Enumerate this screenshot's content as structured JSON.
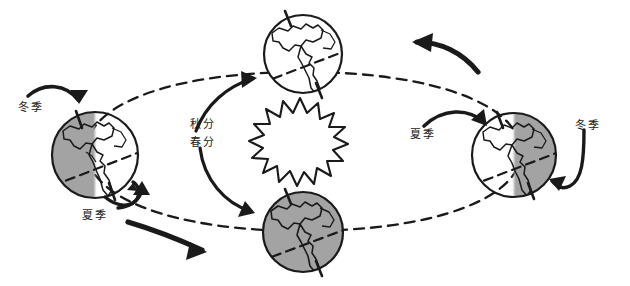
{
  "diagram": {
    "background_color": "#ffffff",
    "ink_color": "#1a1a1a",
    "shade_color": "#a3a3a3",
    "style": "hand-drawn-sketch"
  },
  "sun": {
    "name": "sun-starburst",
    "fill": "#ffffff",
    "stroke": "#1a1a1a",
    "points": 15,
    "center_x": 300,
    "center_y": 142
  },
  "orbit": {
    "name": "orbit-ellipse",
    "stroke": "#1a1a1a",
    "dash": "9 7",
    "center_x": 300,
    "center_y": 142,
    "radius_x": 215,
    "radius_y": 88
  },
  "globes": [
    {
      "id": "globe-left",
      "position": "left",
      "cx": 95,
      "cy": 155,
      "r": 44,
      "shade": "left-half",
      "label_season": "冬季"
    },
    {
      "id": "globe-top",
      "position": "top",
      "cx": 303,
      "cy": 54,
      "r": 40,
      "shade": "none",
      "label_season": "秋分"
    },
    {
      "id": "globe-bottom",
      "position": "bottom",
      "cx": 303,
      "cy": 232,
      "r": 41,
      "shade": "full",
      "label_season": "春分"
    },
    {
      "id": "globe-right",
      "position": "right",
      "cx": 514,
      "cy": 155,
      "r": 43,
      "shade": "right-half",
      "label_season": "夏季"
    }
  ],
  "labels": [
    {
      "id": "label-winter-left",
      "text": "冬季",
      "meaning": "winter",
      "x": 18,
      "y": 101
    },
    {
      "id": "label-summer-left",
      "text": "夏季",
      "meaning": "summer",
      "x": 82,
      "y": 209
    },
    {
      "id": "label-autumn-equinox",
      "text": "秋分",
      "meaning": "autumn equinox",
      "x": 190,
      "y": 118
    },
    {
      "id": "label-spring-equinox",
      "text": "春分",
      "meaning": "spring equinox",
      "x": 190,
      "y": 136
    },
    {
      "id": "label-summer-right",
      "text": "夏季",
      "meaning": "summer",
      "x": 410,
      "y": 128
    },
    {
      "id": "label-winter-right",
      "text": "冬季",
      "meaning": "winter",
      "x": 575,
      "y": 119
    }
  ],
  "arrows": {
    "orbit_direction_top": "leftward",
    "orbit_direction_bottom": "rightward"
  }
}
